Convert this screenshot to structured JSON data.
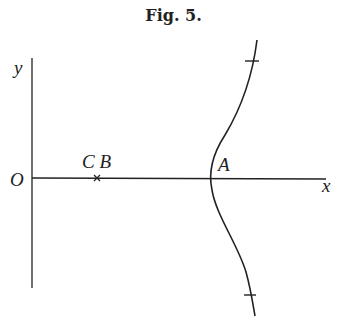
{
  "figure": {
    "title": "Fig. 5.",
    "labels": {
      "y_axis": "y",
      "x_axis": "x",
      "origin": "O",
      "point_cb": "C B",
      "point_a": "A"
    },
    "colors": {
      "ink": "#222222",
      "background": "#ffffff"
    }
  }
}
